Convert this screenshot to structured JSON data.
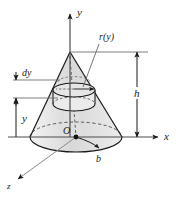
{
  "figure": {
    "caption": "",
    "colors": {
      "stroke": "#1a1a1a",
      "axis": "#4d4d4d",
      "dashed": "#555555",
      "shade_light": "#e3e3e3",
      "shade_mid": "#d2d2d2",
      "background": "#ffffff"
    }
  },
  "axes": [
    {
      "id": "y",
      "label": "y",
      "direction": "up",
      "arrow": true
    },
    {
      "id": "x",
      "label": "x",
      "direction": "right",
      "arrow": true
    },
    {
      "id": "z",
      "label": "z",
      "direction": "down-left",
      "arrow": true
    }
  ],
  "labels": {
    "radius_function": "r(y)",
    "height": "h",
    "thickness": "dy",
    "variable_height": "y",
    "base_radius": "b",
    "origin": "O"
  },
  "geometry": {
    "apex": {
      "x": 70,
      "y": 52
    },
    "origin": {
      "x": 76,
      "y": 137
    },
    "base_rx": 46,
    "base_ry": 15,
    "disk_top_y": 88,
    "disk_bottom_y": 104,
    "disk_rx": 21,
    "disk_ry": 7
  },
  "dimensions": {
    "height_line_x": 137,
    "height_top_y": 52,
    "height_bottom_y": 137,
    "y_line_x": 16,
    "y_top_y": 99,
    "y_bottom_y": 137,
    "dy_top_y": 80,
    "dy_bottom_y": 98
  }
}
